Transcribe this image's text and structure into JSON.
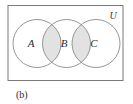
{
  "figure": {
    "caption": "(b)",
    "universe_label": "U",
    "sets": [
      {
        "id": "A",
        "label": "A",
        "cx": 37,
        "cy": 43.5,
        "r": 24
      },
      {
        "id": "B",
        "label": "B",
        "cx": 66.5,
        "cy": 43.5,
        "r": 24
      },
      {
        "id": "C",
        "label": "C",
        "cx": 96,
        "cy": 43.5,
        "r": 24
      }
    ],
    "shaded_regions": [
      {
        "name": "A-intersect-B",
        "fill": "#e2e2e2"
      },
      {
        "name": "B-intersect-C",
        "fill": "#e2e2e2"
      }
    ],
    "frame": {
      "x": 8,
      "y": 5.5,
      "width": 115,
      "height": 75,
      "stroke": "#7a7a7a",
      "fill": "#ffffff"
    },
    "label_positions": {
      "A": {
        "x": 31,
        "y": 47
      },
      "B": {
        "x": 64,
        "y": 47
      },
      "C": {
        "x": 94,
        "y": 47
      },
      "U": {
        "x": 113,
        "y": 19
      },
      "caption": {
        "x": 16,
        "y": 98
      }
    },
    "colors": {
      "circle_stroke": "#8a8a8a",
      "frame_stroke": "#7a7a7a",
      "shade_fill": "#e2e2e2",
      "text": "#2b2b2b",
      "background": "#ffffff"
    }
  }
}
